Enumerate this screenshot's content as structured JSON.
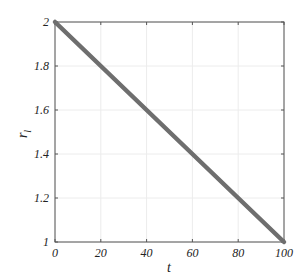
{
  "chart_data": {
    "type": "line",
    "title": "",
    "xlabel": "t",
    "ylabel": "r_l",
    "ylabel_main": "r",
    "ylabel_sub": "l",
    "xlim": [
      0,
      100
    ],
    "ylim": [
      1,
      2
    ],
    "grid": true,
    "x_ticks": [
      "0",
      "20",
      "40",
      "60",
      "80",
      "100"
    ],
    "y_ticks": [
      "1",
      "1.2",
      "1.4",
      "1.6",
      "1.8",
      "2"
    ],
    "series": [
      {
        "name": "r_l",
        "color": "#6e6e6e",
        "x": [
          0,
          100
        ],
        "y": [
          2,
          1
        ]
      }
    ]
  }
}
